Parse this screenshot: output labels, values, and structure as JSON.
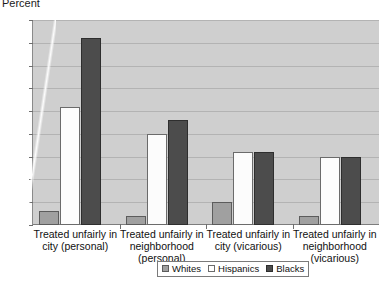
{
  "chart_data": {
    "type": "bar",
    "title": "",
    "ylabel": "Percent",
    "xlabel": "",
    "ylim": [
      0,
      45
    ],
    "ytick_step": 5,
    "yticks": [
      45,
      40,
      35,
      30,
      25,
      20,
      15,
      10,
      5,
      0
    ],
    "grid": true,
    "legend_position": "bottom",
    "categories": [
      "Treated unfairly in city (personal)",
      "Treated unfairly in neighborhood (personal)",
      "Treated unfairly in city (vicarious)",
      "Treated unfairly in neighborhood (vicarious)"
    ],
    "series": [
      {
        "name": "Whites",
        "color": "#a0a0a0",
        "values": [
          3,
          2,
          5,
          2
        ]
      },
      {
        "name": "Hispanics",
        "color": "#ffffff",
        "values": [
          26,
          20,
          16,
          15
        ]
      },
      {
        "name": "Blacks",
        "color": "#4c4c4c",
        "values": [
          41,
          23,
          16,
          15
        ]
      }
    ]
  },
  "axis": {
    "y_title": "Percent"
  },
  "legend": {
    "items": [
      {
        "label": "Whites"
      },
      {
        "label": "Hispanics"
      },
      {
        "label": "Blacks"
      }
    ]
  }
}
